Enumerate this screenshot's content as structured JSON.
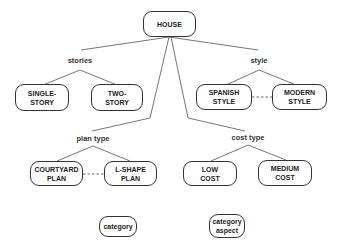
{
  "diagram": {
    "root": {
      "label": "HOUSE"
    },
    "aspects": [
      {
        "label": "stories",
        "children": [
          "SINGLE-\nSTORY",
          "TWO-\nSTORY"
        ],
        "dashed_link": false
      },
      {
        "label": "style",
        "children": [
          "SPANISH\nSTYLE",
          "MODERN\nSTYLE"
        ],
        "dashed_link": true
      },
      {
        "label": "plan type",
        "children": [
          "COURTYARD\nPLAN",
          "L-SHAPE\nPLAN"
        ],
        "dashed_link": true
      },
      {
        "label": "cost type",
        "children": [
          "LOW\nCOST",
          "MEDIUM\nCOST"
        ],
        "dashed_link": false
      }
    ],
    "legend": {
      "category": "category",
      "category_aspect": "category\naspect"
    }
  }
}
